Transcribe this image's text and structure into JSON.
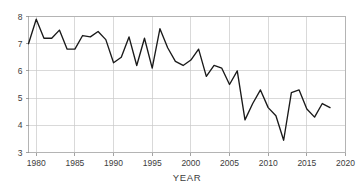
{
  "chart_data": {
    "type": "line",
    "title": "",
    "subtitle": "",
    "xlabel": "YEAR",
    "ylabel": "",
    "xlim": [
      1979,
      2020
    ],
    "ylim": [
      3,
      8
    ],
    "grid": true,
    "legend": false,
    "legend_position": "none",
    "line_color": "#1a1a1a",
    "grid_color": "#c9c9c9",
    "frame_color": "#b4b4b4",
    "x_ticks": [
      1980,
      1985,
      1990,
      1995,
      2000,
      2005,
      2010,
      2015,
      2020
    ],
    "x_tick_labels": [
      "1980",
      "1985",
      "1990",
      "1995",
      "2000",
      "2005",
      "2010",
      "2015",
      "2020"
    ],
    "y_ticks": [
      3,
      4,
      5,
      6,
      7,
      8
    ],
    "y_tick_labels": [
      "3",
      "4",
      "5",
      "6",
      "7",
      "8"
    ],
    "x": [
      1979,
      1980,
      1981,
      1982,
      1983,
      1984,
      1985,
      1986,
      1987,
      1988,
      1989,
      1990,
      1991,
      1992,
      1993,
      1994,
      1995,
      1996,
      1997,
      1998,
      1999,
      2000,
      2001,
      2002,
      2003,
      2004,
      2005,
      2006,
      2007,
      2008,
      2009,
      2010,
      2011,
      2012,
      2013,
      2014,
      2015,
      2016,
      2017,
      2018
    ],
    "values": [
      7.0,
      7.9,
      7.2,
      7.2,
      7.5,
      6.8,
      6.8,
      7.3,
      7.25,
      7.45,
      7.15,
      6.3,
      6.5,
      7.25,
      6.2,
      7.2,
      6.1,
      7.55,
      6.85,
      6.35,
      6.2,
      6.4,
      6.8,
      5.8,
      6.2,
      6.1,
      5.5,
      6.0,
      4.2,
      4.8,
      5.3,
      4.65,
      4.35,
      3.45,
      5.2,
      5.3,
      4.6,
      4.3,
      4.8,
      4.65
    ],
    "series": [
      {
        "name": "value",
        "values": [
          7.0,
          7.9,
          7.2,
          7.2,
          7.5,
          6.8,
          6.8,
          7.3,
          7.25,
          7.45,
          7.15,
          6.3,
          6.5,
          7.25,
          6.2,
          7.2,
          6.1,
          7.55,
          6.85,
          6.35,
          6.2,
          6.4,
          6.8,
          5.8,
          6.2,
          6.1,
          5.5,
          6.0,
          4.2,
          4.8,
          5.3,
          4.65,
          4.35,
          3.45,
          5.2,
          5.3,
          4.6,
          4.3,
          4.8,
          4.65
        ]
      }
    ]
  }
}
